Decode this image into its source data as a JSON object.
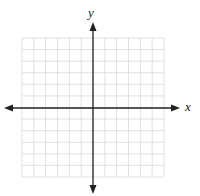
{
  "chart_data": {
    "type": "scatter",
    "title": "",
    "xlabel": "x",
    "ylabel": "y",
    "grid": true,
    "grid_cells": {
      "columns": 12,
      "rows": 12
    },
    "xlim": [
      -6,
      6
    ],
    "ylim": [
      -6,
      6
    ],
    "tick_labels": [],
    "series": [],
    "axis_arrows": true,
    "legend": null
  },
  "labels": {
    "x_axis": "x",
    "y_axis": "y"
  },
  "colors": {
    "grid": "#d9d9d9",
    "axis": "#222222",
    "background": "#ffffff"
  }
}
